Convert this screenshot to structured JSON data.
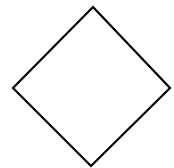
{
  "diagram": {
    "background": "#ffffff",
    "shape": {
      "type": "diamond",
      "label": "",
      "stroke_color": "#000000",
      "fill_color": "#ffffff",
      "stroke_width": 2.2,
      "points": "93,7 170,88 91,166 13,88"
    }
  }
}
